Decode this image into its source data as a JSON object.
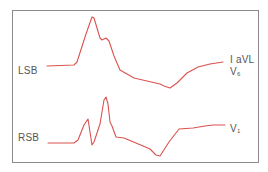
{
  "diagram": {
    "title": "",
    "trace_color": "#d9534f",
    "border_color": "#8a8a8a",
    "traces": [
      {
        "id": "lsb",
        "left_label": "LSB",
        "right_labels": [
          {
            "text": "I aVL",
            "sub": ""
          },
          {
            "text": "V",
            "sub": "6"
          }
        ],
        "description": "Left sternal border QRS complex: flat baseline, tall peak with notched shoulder, descending to trough then recovering"
      },
      {
        "id": "rsb",
        "left_label": "RSB",
        "right_labels": [
          {
            "text": "V",
            "sub": "1"
          }
        ],
        "description": "Right sternal border complex: flat baseline, small spike, sharp dip, tall spike, then descent to trough and recovery"
      }
    ]
  },
  "labels": {
    "lsb": "LSB",
    "rsb": "RSB",
    "iavl": "I aVL",
    "v6_base": "V",
    "v6_sub": "6",
    "v1_base": "V",
    "v1_sub": "1"
  }
}
